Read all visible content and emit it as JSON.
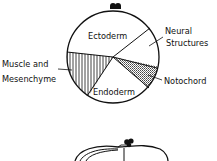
{
  "diagram": {
    "type": "fate-map",
    "regions": [
      {
        "id": "ectoderm",
        "label": "Ectoderm",
        "fill": "none"
      },
      {
        "id": "neural",
        "label_lines": [
          "Neural",
          "Structures"
        ],
        "fill": "none"
      },
      {
        "id": "notochord",
        "label": "Notochord",
        "fill": "stippled"
      },
      {
        "id": "endoderm",
        "label": "Endoderm",
        "fill": "none"
      },
      {
        "id": "muscle",
        "label_lines": [
          "Muscle and",
          "Mesenchyme"
        ],
        "fill": "vertical-hatch"
      }
    ],
    "labels": {
      "ectoderm": "Ectoderm",
      "neural_1": "Neural",
      "neural_2": "Structures",
      "notochord": "Notochord",
      "endoderm": "Endoderm",
      "muscle_1": "Muscle and",
      "muscle_2": "Mesenchyme"
    },
    "colors": {
      "ink": "#111111",
      "paper": "#ffffff"
    }
  }
}
